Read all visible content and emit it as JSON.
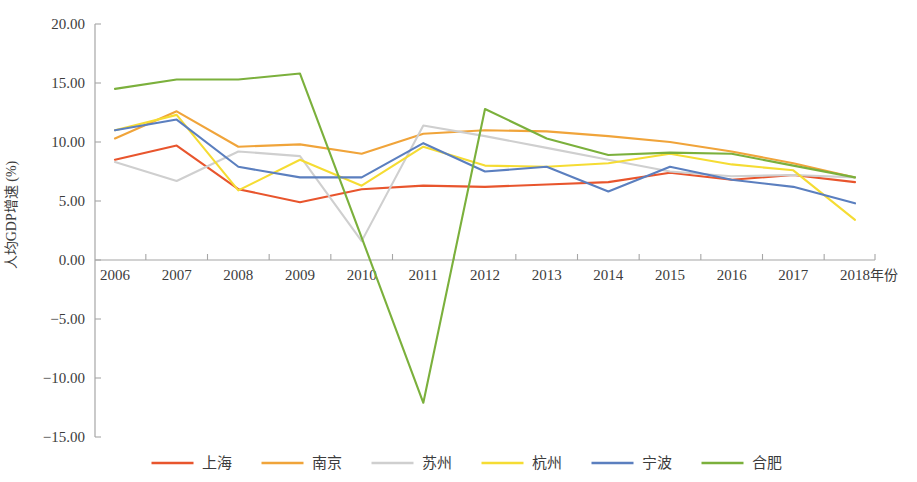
{
  "chart_data": {
    "type": "line",
    "title": "",
    "xlabel": "年份",
    "ylabel": "人均GDP增速 (%)",
    "categories": [
      "2006",
      "2007",
      "2008",
      "2009",
      "2010",
      "2011",
      "2012",
      "2013",
      "2014",
      "2015",
      "2016",
      "2017",
      "2018"
    ],
    "x": [
      2006,
      2007,
      2008,
      2009,
      2010,
      2011,
      2012,
      2013,
      2014,
      2015,
      2016,
      2017,
      2018
    ],
    "xlim": [
      2006,
      2018
    ],
    "ylim": [
      -15.0,
      20.0
    ],
    "ytick_labels": [
      "20.00",
      "15.00",
      "10.00",
      "5.00",
      "0.00",
      "-5.00",
      "-10.00",
      "-15.00"
    ],
    "ytick_values": [
      20.0,
      15.0,
      10.0,
      5.0,
      0.0,
      -5.0,
      -10.0,
      -15.0
    ],
    "grid": false,
    "legend_position": "bottom",
    "series": [
      {
        "name": "上海",
        "color": "#E8552D",
        "dash": "none",
        "values": [
          8.5,
          9.7,
          6.0,
          4.9,
          6.0,
          6.3,
          6.2,
          6.4,
          6.6,
          7.4,
          6.8,
          7.2,
          6.6
        ]
      },
      {
        "name": "南京",
        "color": "#F0A43A",
        "dash": "none",
        "values": [
          10.3,
          12.6,
          9.6,
          9.8,
          9.0,
          10.7,
          11.0,
          10.9,
          10.5,
          10.0,
          9.2,
          8.2,
          7.0
        ]
      },
      {
        "name": "苏州",
        "color": "#CFCFCF",
        "dash": "none",
        "values": [
          8.3,
          6.7,
          9.2,
          8.8,
          1.6,
          11.4,
          10.5,
          9.5,
          8.5,
          7.5,
          7.1,
          7.2,
          7.0
        ]
      },
      {
        "name": "杭州",
        "color": "#F5DC33",
        "dash": "none",
        "values": [
          11.0,
          12.3,
          5.9,
          8.5,
          6.3,
          9.6,
          8.0,
          7.9,
          8.2,
          9.0,
          8.1,
          7.6,
          3.4
        ]
      },
      {
        "name": "宁波",
        "color": "#5B7FBF",
        "dash": "none",
        "values": [
          11.0,
          11.9,
          7.9,
          7.0,
          7.0,
          9.9,
          7.5,
          7.9,
          5.8,
          7.9,
          6.8,
          6.2,
          4.8
        ]
      },
      {
        "name": "合肥",
        "color": "#7BB03C",
        "dash": "none",
        "values": [
          14.5,
          15.3,
          15.3,
          15.8,
          1.9,
          -12.1,
          12.8,
          10.3,
          8.9,
          9.1,
          9.0,
          8.0,
          7.0
        ]
      }
    ]
  },
  "legend": {
    "items": [
      {
        "label": "上海",
        "color": "#E8552D"
      },
      {
        "label": "南京",
        "color": "#F0A43A"
      },
      {
        "label": "苏州",
        "color": "#CFCFCF"
      },
      {
        "label": "杭州",
        "color": "#F5DC33"
      },
      {
        "label": "宁波",
        "color": "#5B7FBF"
      },
      {
        "label": "合肥",
        "color": "#7BB03C"
      }
    ]
  }
}
